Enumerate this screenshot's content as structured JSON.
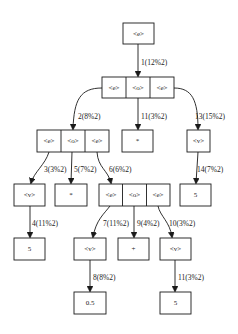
{
  "diagram": {
    "type": "parse-tree",
    "nodes": {
      "root": {
        "label": "<e>"
      },
      "r2": {
        "cells": [
          "<e>",
          "<o>",
          "<e>"
        ]
      },
      "r3a": {
        "cells": [
          "<e>",
          "<o>",
          "<e>"
        ]
      },
      "r3b": {
        "label": "*"
      },
      "r3c": {
        "label": "<v>"
      },
      "r4a": {
        "label": "<v>"
      },
      "r4b": {
        "label": "*"
      },
      "r4c": {
        "cells": [
          "<e>",
          "<o>",
          "<e>"
        ]
      },
      "r4d": {
        "label": "5"
      },
      "r5a": {
        "label": "5"
      },
      "r5b": {
        "label": "<v>"
      },
      "r5c": {
        "label": "+"
      },
      "r5d": {
        "label": "<v>"
      },
      "r6a": {
        "label": "0.5"
      },
      "r6b": {
        "label": "5"
      }
    },
    "edges": [
      {
        "id": "e1",
        "label": "1(12%2)"
      },
      {
        "id": "e2",
        "label": "2(8%2)"
      },
      {
        "id": "e3",
        "label": "3(3%2)"
      },
      {
        "id": "e4",
        "label": "4(11%2)"
      },
      {
        "id": "e5",
        "label": "5(7%2)"
      },
      {
        "id": "e6",
        "label": "6(6%2)"
      },
      {
        "id": "e7",
        "label": "7(11%2)"
      },
      {
        "id": "e8",
        "label": "8(8%2)"
      },
      {
        "id": "e9",
        "label": "9(4%2)"
      },
      {
        "id": "e10",
        "label": "10(3%2)"
      },
      {
        "id": "e11",
        "label": "11(3%2)"
      },
      {
        "id": "e12",
        "label": "12(11%2)"
      },
      {
        "id": "e13",
        "label": "13(15%2)"
      },
      {
        "id": "e14",
        "label": "14(7%2)"
      }
    ]
  }
}
